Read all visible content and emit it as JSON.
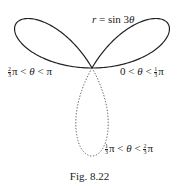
{
  "figure": {
    "equation": {
      "lhs": "r",
      "eq": " = sin 3",
      "theta": "θ"
    },
    "labels": {
      "left_petal": {
        "frac_num": "2",
        "frac_den": "3",
        "text_a": "π < ",
        "theta": "θ",
        "text_b": " < π"
      },
      "right_petal": {
        "text_a": "0 < ",
        "theta": "θ",
        "text_b": " < ",
        "frac_num": "1",
        "frac_den": "3",
        "text_c": "π"
      },
      "bottom_petal": {
        "frac_num": "1",
        "frac_den": "3",
        "text_a": "π < ",
        "theta": "θ",
        "text_b": " < ",
        "frac_num2": "2",
        "frac_den2": "3",
        "text_c": "π"
      }
    },
    "caption": "Fig. 8.22",
    "colors": {
      "curve": "#222222",
      "dotted": "#555555",
      "background": "#ffffff"
    },
    "curve": {
      "type": "polar-rose",
      "formula": "r = sin 3θ",
      "solid_ranges": [
        "0 < θ < π/3",
        "2π/3 < θ < π"
      ],
      "dotted_range": "π/3 < θ < 2π/3"
    }
  }
}
